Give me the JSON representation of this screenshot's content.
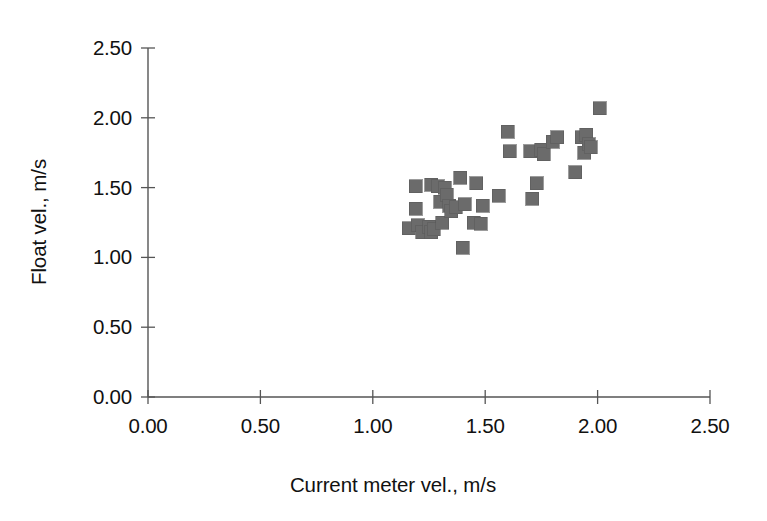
{
  "chart_data": {
    "type": "scatter",
    "title": "",
    "xlabel": "Current meter vel., m/s",
    "ylabel": "Float vel., m/s",
    "xlim": [
      0.0,
      2.5
    ],
    "ylim": [
      0.0,
      2.5
    ],
    "xticks": [
      "0.00",
      "0.50",
      "1.00",
      "1.50",
      "2.00",
      "2.50"
    ],
    "yticks": [
      "0.00",
      "0.50",
      "1.00",
      "1.50",
      "2.00",
      "2.50"
    ],
    "xtick_values": [
      0.0,
      0.5,
      1.0,
      1.5,
      2.0,
      2.5
    ],
    "ytick_values": [
      0.0,
      0.5,
      1.0,
      1.5,
      2.0,
      2.5
    ],
    "grid": false,
    "legend": null,
    "marker_style": "filled-square",
    "marker_color": "#6b6b6b",
    "marker_size": 13,
    "axis_color": "#555555",
    "background_color": "#ffffff",
    "series": [
      {
        "name": "Float vel. vs Current meter vel.",
        "points": [
          [
            1.16,
            1.21
          ],
          [
            1.19,
            1.51
          ],
          [
            1.19,
            1.35
          ],
          [
            1.2,
            1.23
          ],
          [
            1.22,
            1.18
          ],
          [
            1.25,
            1.22
          ],
          [
            1.26,
            1.52
          ],
          [
            1.26,
            1.18
          ],
          [
            1.27,
            1.2
          ],
          [
            1.29,
            1.51
          ],
          [
            1.3,
            1.4
          ],
          [
            1.31,
            1.25
          ],
          [
            1.32,
            1.5
          ],
          [
            1.33,
            1.45
          ],
          [
            1.34,
            1.37
          ],
          [
            1.35,
            1.33
          ],
          [
            1.37,
            1.36
          ],
          [
            1.39,
            1.57
          ],
          [
            1.4,
            1.07
          ],
          [
            1.41,
            1.38
          ],
          [
            1.45,
            1.25
          ],
          [
            1.46,
            1.53
          ],
          [
            1.48,
            1.24
          ],
          [
            1.49,
            1.37
          ],
          [
            1.56,
            1.44
          ],
          [
            1.6,
            1.9
          ],
          [
            1.61,
            1.76
          ],
          [
            1.7,
            1.76
          ],
          [
            1.71,
            1.42
          ],
          [
            1.73,
            1.53
          ],
          [
            1.75,
            1.77
          ],
          [
            1.76,
            1.74
          ],
          [
            1.8,
            1.83
          ],
          [
            1.82,
            1.86
          ],
          [
            1.9,
            1.61
          ],
          [
            1.93,
            1.86
          ],
          [
            1.94,
            1.75
          ],
          [
            1.95,
            1.88
          ],
          [
            1.96,
            1.81
          ],
          [
            1.97,
            1.79
          ],
          [
            2.01,
            2.07
          ]
        ]
      }
    ]
  },
  "figure": {
    "plot_area": {
      "x_origin_px": 148,
      "y_origin_px": 397,
      "x_px_per_unit": 224.8,
      "y_px_per_unit": 139.6
    }
  }
}
